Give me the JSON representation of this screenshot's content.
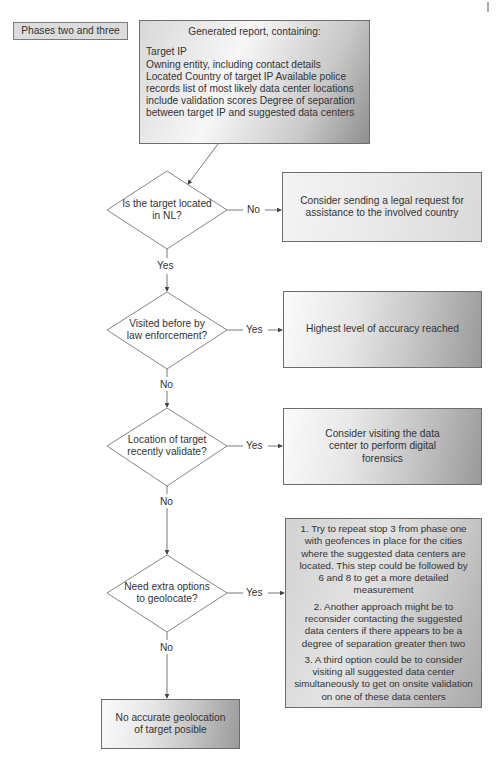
{
  "phase_label": "Phases two and three",
  "report": {
    "title": "Generated report, containing:",
    "lines": [
      "Target IP",
      "Owning entity, including contact details",
      "Located Country of target IP Available police",
      "records list of most likely data center locations",
      "include validation scores Degree of separation",
      "between target IP and suggested data centers"
    ]
  },
  "decisions": [
    {
      "lines": [
        "Is the target located",
        "in NL?"
      ],
      "side_label": "No",
      "down_label": "Yes"
    },
    {
      "lines": [
        "Visited before by",
        "law enforcement?"
      ],
      "side_label": "Yes",
      "down_label": "No"
    },
    {
      "lines": [
        "Location of target",
        "recently validate?"
      ],
      "side_label": "Yes",
      "down_label": "No"
    },
    {
      "lines": [
        "Need extra options",
        "to geolocate?"
      ],
      "side_label": "Yes",
      "down_label": "No"
    }
  ],
  "outcomes": [
    {
      "lines": [
        "Consider sending a legal request for",
        "assistance to the involved country"
      ]
    },
    {
      "lines": [
        "Highest level of accuracy reached"
      ]
    },
    {
      "lines": [
        "Consider visiting the data",
        "center to perform digital",
        "forensics"
      ]
    },
    {
      "paragraphs": [
        [
          "1. Try to repeat stop 3 from phase one",
          "with geofences in place for the cities",
          "where the suggested data centers are",
          "located. This step could be followed by",
          "6 and 8 to get a more detailed",
          "measurement"
        ],
        [
          "2. Another approach might be to",
          "reconsider contacting the suggested",
          "data centers if there appears to be a",
          "degree of separation greater then two"
        ],
        [
          "3. A third option could be to consider",
          "visiting all suggested data center",
          "simultaneously to get on onsite validation",
          "on one of these data centers"
        ]
      ]
    }
  ],
  "final": {
    "lines": [
      "No accurate geolocation",
      "of target posible"
    ]
  }
}
